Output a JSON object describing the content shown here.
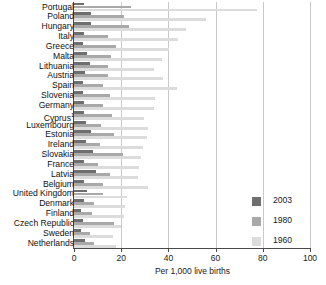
{
  "chart_data": {
    "type": "bar",
    "orientation": "horizontal",
    "title": "",
    "xlabel": "Per 1,000 live births",
    "ylabel": "",
    "xlim": [
      0,
      100
    ],
    "xticks": [
      0,
      20,
      40,
      60,
      80,
      100
    ],
    "grid": "vertical",
    "legend_position": "right-lower",
    "categories": [
      "Portugal",
      "Poland",
      "Hungary",
      "Italy",
      "Greece",
      "Malta",
      "Lithuania",
      "Austria",
      "Spain",
      "Slovenia",
      "Germany",
      "Cyprus",
      "Luxembourg",
      "Estonia",
      "Ireland",
      "Slovakia",
      "France",
      "Latvia",
      "Belgium",
      "United Kingdom",
      "Denmark",
      "Finland",
      "Czech Republic",
      "Sweden",
      "Netherlands"
    ],
    "category_notes": {
      "Cyprus": "1"
    },
    "series": [
      {
        "name": "2003",
        "color": "#6e6e6e",
        "values": [
          4.1,
          7.0,
          7.3,
          4.3,
          4.0,
          5.7,
          6.7,
          4.5,
          3.9,
          4.0,
          4.2,
          4.1,
          4.9,
          7.0,
          5.1,
          7.9,
          4.2,
          9.4,
          4.3,
          5.3,
          4.4,
          3.1,
          3.9,
          3.1,
          4.8
        ]
      },
      {
        "name": "1980",
        "color": "#a9a9a9",
        "values": [
          24.3,
          21.3,
          23.2,
          14.6,
          17.9,
          15.5,
          14.5,
          14.3,
          12.3,
          15.3,
          12.4,
          16.0,
          11.5,
          17.1,
          11.1,
          20.9,
          10.0,
          15.3,
          12.1,
          12.1,
          8.4,
          7.6,
          16.9,
          6.9,
          8.6
        ]
      },
      {
        "name": "1960",
        "color": "#dcdcdc",
        "values": [
          77.5,
          56.1,
          47.6,
          43.9,
          40.1,
          37.1,
          34.0,
          37.5,
          43.7,
          34.5,
          33.8,
          29.7,
          31.5,
          31.0,
          29.3,
          28.6,
          27.4,
          27.0,
          31.2,
          22.5,
          21.5,
          21.0,
          20.0,
          16.6,
          17.9
        ]
      }
    ]
  }
}
